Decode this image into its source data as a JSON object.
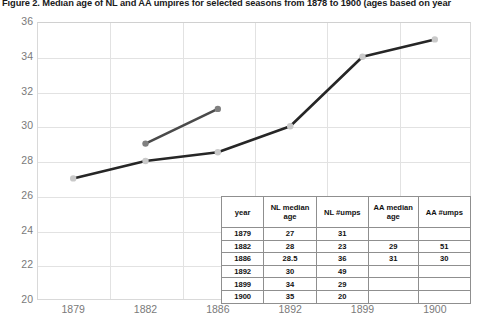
{
  "title": "Figure 2. Median age of NL and AA umpires for selected seasons from 1878 to 1900 (ages based on year",
  "chart_data": {
    "type": "line",
    "title": "Figure 2. Median age of NL and AA umpires for selected seasons from 1878 to 1900 (ages based on year",
    "xlabel": "",
    "ylabel": "",
    "categories": [
      "1879",
      "1882",
      "1886",
      "1892",
      "1899",
      "1900"
    ],
    "ylim": [
      20,
      36
    ],
    "yticks": [
      20,
      22,
      24,
      26,
      28,
      30,
      32,
      34,
      36
    ],
    "grid": true,
    "legend": "none",
    "series": [
      {
        "name": "NL median age",
        "color": "#262626",
        "marker_color": "#c9c9c9",
        "values": [
          27,
          28,
          28.5,
          30,
          34,
          35
        ]
      },
      {
        "name": "AA median age",
        "color": "#4a4a4a",
        "marker_color": "#808080",
        "values": [
          null,
          29,
          31,
          null,
          null,
          null
        ]
      }
    ]
  },
  "table": {
    "headers": [
      "year",
      "NL median age",
      "NL #umps",
      "AA median age",
      "AA #umps"
    ],
    "rows": [
      [
        "1879",
        "27",
        "31",
        "",
        ""
      ],
      [
        "1882",
        "28",
        "23",
        "29",
        "51"
      ],
      [
        "1886",
        "28.5",
        "36",
        "31",
        "30"
      ],
      [
        "1892",
        "30",
        "49",
        "",
        ""
      ],
      [
        "1899",
        "34",
        "29",
        "",
        ""
      ],
      [
        "1900",
        "35",
        "20",
        "",
        ""
      ]
    ]
  }
}
